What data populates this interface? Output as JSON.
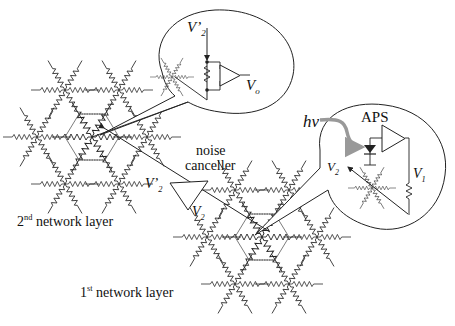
{
  "diagram": {
    "type": "circuit-network-illustration",
    "labels": {
      "layer2": {
        "num": "2",
        "sup": "nd",
        "text": "network layer"
      },
      "layer1": {
        "num": "1",
        "sup": "st",
        "text": "network layer"
      },
      "noise_canceller_line1": "noise",
      "noise_canceller_line2": "canceller",
      "aps": "APS",
      "hv": "hν",
      "v2_prime_top": {
        "main": "V’",
        "sub": "2"
      },
      "v2_prime_mid": {
        "main": "V’",
        "sub": "2"
      },
      "v2_mid": {
        "main": "V",
        "sub": "2"
      },
      "v2_inset": {
        "main": "V",
        "sub": "2"
      },
      "v1_inset": {
        "main": "V",
        "sub": "1"
      },
      "vo": {
        "main": "V",
        "sub": "o"
      }
    },
    "components": [
      {
        "name": "2nd-network-layer",
        "kind": "hexagonal resistor grid",
        "position": "upper-left"
      },
      {
        "name": "1st-network-layer",
        "kind": "hexagonal resistor grid",
        "position": "lower-center"
      },
      {
        "name": "noise-canceller",
        "kind": "triangle amplifier",
        "inputs": [
          "V2"
        ],
        "outputs": [
          "V'2"
        ]
      },
      {
        "name": "inset-top",
        "kind": "magnified node with differential amplifier",
        "signals": [
          "V'2",
          "Vo"
        ]
      },
      {
        "name": "inset-right",
        "kind": "magnified node with photodiode and APS",
        "signals": [
          "hv",
          "V1",
          "V2"
        ]
      }
    ],
    "colors": {
      "line": "#222222",
      "hv_arrow": "#999999",
      "background": "#ffffff"
    }
  }
}
